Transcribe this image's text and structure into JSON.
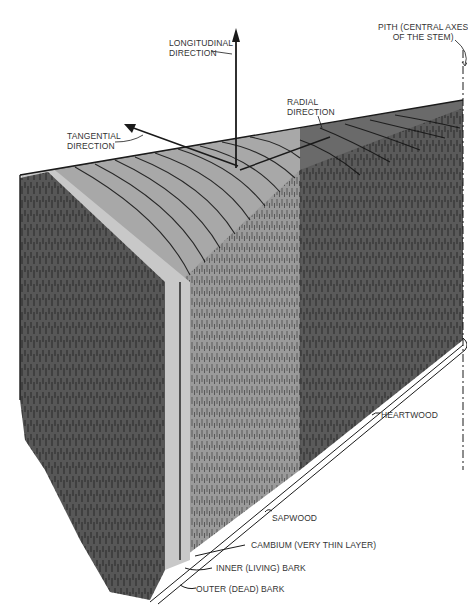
{
  "diagram": {
    "directions": {
      "longitudinal": [
        "LONGITUDINAL",
        "DIRECTION"
      ],
      "tangential": [
        "TANGENTIAL",
        "DIRECTION"
      ],
      "radial": [
        "RADIAL",
        "DIRECTION"
      ],
      "pith": [
        "PITH (CENTRAL AXES",
        "OF THE STEM)"
      ]
    },
    "layers": {
      "heartwood": "HEARTWOOD",
      "sapwood": "SAPWOOD",
      "cambium": "CAMBIUM (VERY THIN LAYER)",
      "inner_bark": "INNER (LIVING) BARK",
      "outer_bark": "OUTER (DEAD) BARK"
    },
    "colors": {
      "heartwood": "#5a5a5a",
      "sapwood": "#9a9a9a",
      "cambium_strip": "#c8c8c8",
      "bark": "#555555",
      "line": "#1a1a1a"
    }
  }
}
